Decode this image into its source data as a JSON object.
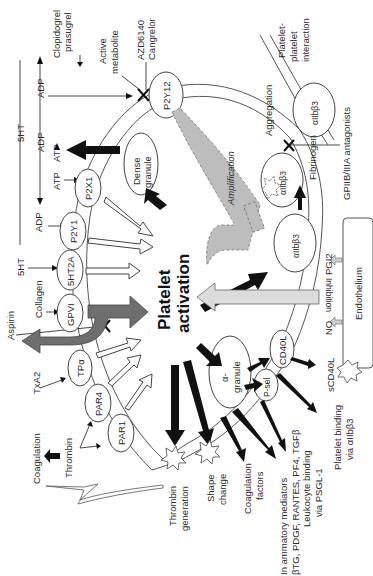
{
  "figure": {
    "orientation": "rotated-90-ccw",
    "center_label": [
      "Platelet",
      "activation"
    ],
    "colors": {
      "black_arrow": "#111111",
      "open_arrow": "#ffffff",
      "aspirin_arrow": "#6e6e6e",
      "amplification": "#bdbdbd",
      "inhibition": "#dcdcdc",
      "line": "#333333"
    }
  },
  "receptors": {
    "p2y12": "P2Y12",
    "p2x1": "P2X1",
    "p2y1": "P2Y1",
    "ht2a": "5HT2A",
    "gpvi": "GPVI",
    "tpa": "TPα",
    "par4": "PAR4",
    "par1": "PAR1",
    "aiib_top": "αIIbβ3",
    "aiib_mid": "αIIbβ3",
    "aiib_low": "αIIbβ3",
    "cd40l": "CD40L",
    "psel": "P-sel"
  },
  "granules": {
    "dense": [
      "Dense",
      "granule"
    ],
    "alpha": [
      "α-",
      "granule"
    ]
  },
  "agonists": {
    "fivehtTop": "5HT",
    "adpTop": "ADP",
    "atpTop": "ATP",
    "adpArrow": "ADP",
    "adpRight": "ADP",
    "atpLeft": "ATP",
    "adpLeft": "ADP",
    "fivehtLeft": "5HT",
    "collagen": "Collagen",
    "aspirin": "Aspirin",
    "txa2": "TxA2",
    "thrombin": "Thrombin",
    "coagulation": "Coagulation"
  },
  "drugs": {
    "clopidogrel": [
      "Clopidogrel",
      "prasugrel"
    ],
    "active_metabolite": [
      "Active",
      "metabolite"
    ],
    "azd": [
      "AZD6140",
      "Cangrelor"
    ],
    "gp2b3a": "GPIIB/IIIA antagonists"
  },
  "outcomes": {
    "platelet_interaction": [
      "Platelet-",
      "platelet",
      "interaction"
    ],
    "aggregation": "Aggregation",
    "amplification": "Amplification",
    "fibrinogen": "Fibrinogen",
    "inhibition": "Inhibition",
    "no": "NO",
    "pgi2": "PGI2",
    "endothelium": "Endothelium",
    "scd40l": "sCD40L",
    "platelet_binding": [
      "Platelet binding",
      "via αIIbβ3"
    ],
    "leukocyte_binding": [
      "Leukocyte binding",
      "via PSGL-1"
    ],
    "inflammatory": [
      "In ammatory mediators",
      "βTG, PDGF, RANTES, PF4, TGFβ"
    ],
    "coag_factors": [
      "Coagulation",
      "factors"
    ],
    "shape_change": [
      "Shape",
      "change"
    ],
    "thrombin_gen": [
      "Thrombin",
      "generation"
    ]
  }
}
